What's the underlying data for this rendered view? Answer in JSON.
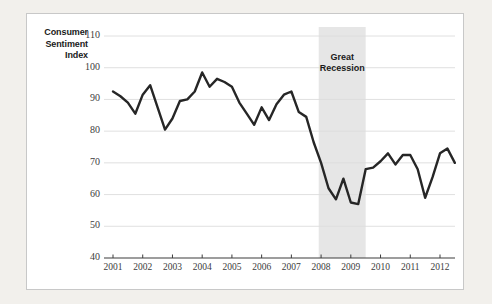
{
  "chart_data": {
    "type": "line",
    "title": "",
    "xlabel": "",
    "ylabel": "Consumer Sentiment Index",
    "ylabel_lines": [
      "Consumer",
      "Sentiment",
      "Index"
    ],
    "ylim": [
      40,
      110
    ],
    "yticks": [
      40,
      50,
      60,
      70,
      80,
      90,
      100,
      110
    ],
    "ytick_labels": [
      "40",
      "50",
      "60",
      "70",
      "80",
      "90",
      "100",
      "110"
    ],
    "xlim": [
      2001.0,
      2012.75
    ],
    "xticks": [
      2001,
      2002,
      2003,
      2004,
      2005,
      2006,
      2007,
      2008,
      2009,
      2010,
      2011,
      2012
    ],
    "xtick_labels": [
      "2001",
      "2002",
      "2003",
      "2004",
      "2005",
      "2006",
      "2007",
      "2008",
      "2009",
      "2010",
      "2011",
      "2012"
    ],
    "grid": "horizontal",
    "legend": "none",
    "series": [
      {
        "name": "Consumer Sentiment Index",
        "color": "#262626",
        "x": [
          2001.0,
          2001.25,
          2001.5,
          2001.75,
          2002.0,
          2002.25,
          2002.5,
          2002.75,
          2003.0,
          2003.25,
          2003.5,
          2003.75,
          2004.0,
          2004.25,
          2004.5,
          2004.75,
          2005.0,
          2005.25,
          2005.5,
          2005.75,
          2006.0,
          2006.25,
          2006.5,
          2006.75,
          2007.0,
          2007.25,
          2007.5,
          2007.75,
          2008.0,
          2008.25,
          2008.5,
          2008.75,
          2009.0,
          2009.25,
          2009.5,
          2009.75,
          2010.0,
          2010.25,
          2010.5,
          2010.75,
          2011.0,
          2011.25,
          2011.5,
          2011.75,
          2012.0,
          2012.25,
          2012.5
        ],
        "values": [
          92.5,
          91.0,
          89.0,
          85.5,
          91.5,
          94.5,
          87.5,
          80.5,
          84.0,
          89.5,
          90.0,
          92.5,
          98.5,
          94.0,
          96.5,
          95.5,
          94.0,
          89.0,
          85.5,
          82.0,
          87.5,
          83.5,
          88.5,
          91.5,
          92.5,
          86.0,
          84.5,
          76.5,
          70.0,
          62.0,
          58.5,
          65.0,
          57.5,
          57.0,
          68.0,
          68.5,
          70.5,
          73.0,
          69.5,
          72.5,
          72.5,
          68.0,
          59.0,
          65.5,
          73.0,
          74.5,
          70.0
        ]
      }
    ],
    "annotations": [
      {
        "id": "great-recession",
        "type": "vspan",
        "label_lines": [
          "Great",
          "Recession"
        ],
        "x_start": 2007.92,
        "x_end": 2009.5,
        "color": "#e6e6e6"
      }
    ]
  },
  "colors": {
    "page_background": "#f2f0ec",
    "card_background": "#ffffff",
    "card_border": "#c8c8c8",
    "line": "#262626",
    "gridline": "#dcdcdc",
    "axis": "#3c3c3c",
    "recession_band": "#e6e6e6",
    "tick_text": "#3c3c3c",
    "label_text": "#1a1a1a"
  }
}
